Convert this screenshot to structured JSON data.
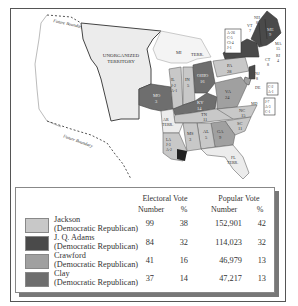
{
  "map": {
    "labels": {
      "unorganized_territory": [
        "UNORGANIZED",
        "TERRITORY"
      ],
      "future_boundary": "Future Boundary",
      "states": [
        {
          "abbr": "MI",
          "sub": "TERR."
        },
        {
          "abbr": "TERR."
        },
        {
          "abbr": "ME",
          "votes": "9"
        },
        {
          "abbr": "NH",
          "votes": "8"
        },
        {
          "abbr": "VT",
          "votes": "7"
        },
        {
          "abbr": "MA",
          "votes": "15"
        },
        {
          "abbr": "RI",
          "votes": "4"
        },
        {
          "abbr": "CT",
          "votes": "8"
        },
        {
          "abbr": "NY",
          "split": [
            "A-26",
            "C-5",
            "Cl-4",
            "J-1"
          ]
        },
        {
          "abbr": "PA",
          "votes": "28"
        },
        {
          "abbr": "NJ",
          "votes": "8"
        },
        {
          "abbr": "DE",
          "split": [
            "C-2",
            "A-1"
          ]
        },
        {
          "abbr": "MD",
          "split": [
            "J-7",
            "A-3",
            "C-1"
          ]
        },
        {
          "abbr": "OHIO",
          "votes": "16"
        },
        {
          "abbr": "IN",
          "votes": "5"
        },
        {
          "abbr": "IL",
          "split": [
            "J-2",
            "A-1"
          ]
        },
        {
          "abbr": "MO",
          "votes": "3"
        },
        {
          "abbr": "KY",
          "votes": "14"
        },
        {
          "abbr": "VA",
          "votes": "24"
        },
        {
          "abbr": "NC",
          "votes": "15"
        },
        {
          "abbr": "SC",
          "votes": "11"
        },
        {
          "abbr": "TN",
          "votes": "11"
        },
        {
          "abbr": "GA",
          "votes": "9"
        },
        {
          "abbr": "AL",
          "votes": "5"
        },
        {
          "abbr": "MS",
          "votes": "3"
        },
        {
          "abbr": "LA",
          "split": [
            "J-3",
            "A-2"
          ]
        },
        {
          "abbr": "AR",
          "sub": "TERR."
        },
        {
          "abbr": "FL",
          "sub": "TERR."
        }
      ]
    }
  },
  "legend": {
    "headers": {
      "electoral": "Electoral Vote",
      "popular": "Popular Vote",
      "number": "Number",
      "percent": "%"
    },
    "rows": [
      {
        "name": "Jackson",
        "party": "(Democratic Republican)",
        "color": "#c8c8c8",
        "ev_num": "99",
        "ev_pct": "38",
        "pv_num": "152,901",
        "pv_pct": "42"
      },
      {
        "name": "J. Q. Adams",
        "party": "(Democratic Republican)",
        "color": "#4a4a4a",
        "ev_num": "84",
        "ev_pct": "32",
        "pv_num": "114,023",
        "pv_pct": "32"
      },
      {
        "name": "Crawford",
        "party": "(Democratic Republican)",
        "color": "#a0a0a0",
        "ev_num": "41",
        "ev_pct": "16",
        "pv_num": "46,979",
        "pv_pct": "13"
      },
      {
        "name": "Clay",
        "party": "(Democratic Republican)",
        "color": "#6e6e6e",
        "ev_num": "37",
        "ev_pct": "14",
        "pv_num": "47,217",
        "pv_pct": "13"
      }
    ]
  },
  "colors": {
    "jackson": "#c8c8c8",
    "adams": "#4a4a4a",
    "crawford": "#a0a0a0",
    "clay": "#6e6e6e",
    "territory": "#ececec"
  }
}
